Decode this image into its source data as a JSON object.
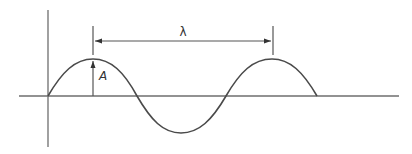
{
  "diagram": {
    "type": "sine-wave",
    "labels": {
      "wavelength": "λ",
      "amplitude": "A"
    },
    "colors": {
      "background": "#ffffff",
      "wave": "#4a4a4a",
      "axis": "#6e6e6e",
      "annotation": "#555555"
    },
    "wave": {
      "cycles": 1.5,
      "start": "peak-first"
    }
  }
}
